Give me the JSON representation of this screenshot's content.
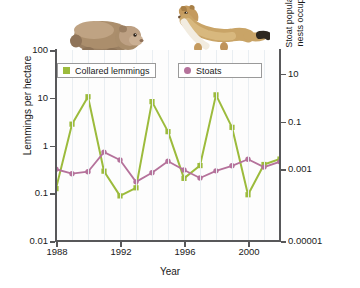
{
  "chart_data": {
    "type": "line",
    "title": "",
    "xlabel": "Year",
    "ylabel": "Lemmings per hectare",
    "ylabel_right": "Stoat population (number of lemming nests occupied by stoat per hectare)",
    "x": [
      1988,
      1989,
      1990,
      1991,
      1992,
      1993,
      1994,
      1995,
      1996,
      1997,
      1998,
      1999,
      2000,
      2001,
      2002
    ],
    "xticks": [
      1988,
      1992,
      1996,
      2000
    ],
    "xlim": [
      1988,
      2002
    ],
    "yscale": "log",
    "ylim": [
      0.01,
      100
    ],
    "yticks": [
      "0.01",
      "0.1",
      "1",
      "10",
      "100"
    ],
    "ylim_right": [
      1e-05,
      10
    ],
    "yticks_right": [
      "0.00001",
      "0.001",
      "0.1",
      "10"
    ],
    "grid": "vertical",
    "legend_position": "top-inside",
    "series": [
      {
        "name": "Collared lemmings",
        "axis": "left",
        "color": "#9cbb3c",
        "marker": "square",
        "values": [
          0.125,
          2.8,
          10.5,
          0.29,
          0.088,
          0.13,
          8.3,
          1.95,
          0.205,
          0.38,
          11.5,
          2.4,
          0.093,
          0.4,
          0.52
        ]
      },
      {
        "name": "Stoats",
        "axis": "right",
        "color": "#b5729b",
        "marker": "circle",
        "values": [
          0.0018,
          0.0013,
          0.0015,
          0.0062,
          0.0035,
          0.00072,
          0.0014,
          0.0032,
          0.0017,
          0.00095,
          0.0016,
          0.0023,
          0.0037,
          0.0021,
          0.0031
        ]
      }
    ]
  },
  "legend": {
    "items": [
      {
        "label": "Collared lemmings",
        "color": "#9cbb3c",
        "marker": "square"
      },
      {
        "label": "Stoats",
        "color": "#b5729b",
        "marker": "circle"
      }
    ]
  },
  "axes": {
    "left": {
      "title": "Lemmings per hectare",
      "ticks": [
        "100",
        "10",
        "1",
        "0.1",
        "0.01"
      ]
    },
    "right": {
      "title_line1": "Stoat population (number of lemming",
      "title_line2": "nests occupied by stoat per hectare)",
      "ticks": [
        "10",
        "0.1",
        "0.001",
        "0.00001"
      ]
    },
    "bottom": {
      "title": "Year",
      "ticks": [
        "1988",
        "1992",
        "1996",
        "2000"
      ]
    }
  },
  "illustrations": [
    {
      "name": "collared-lemming",
      "alt": "Collared lemming"
    },
    {
      "name": "stoat",
      "alt": "Stoat"
    }
  ]
}
